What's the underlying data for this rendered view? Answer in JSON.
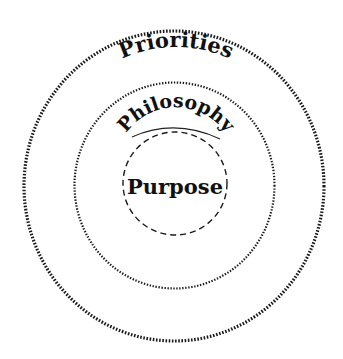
{
  "diagram": {
    "rings": [
      {
        "label": "Priorities",
        "style": "dotted-thick"
      },
      {
        "label": "Philosophy",
        "style": "dotted-thin"
      },
      {
        "label": "Purpose",
        "style": "dashed"
      }
    ],
    "colors": {
      "stroke": "#1a1a1a",
      "text": "#111111",
      "background": "#ffffff"
    }
  }
}
